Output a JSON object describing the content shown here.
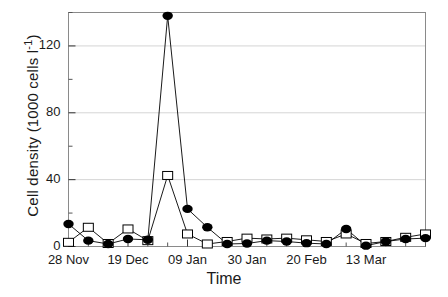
{
  "chart_data": {
    "type": "line",
    "title": "",
    "xlabel": "Time",
    "ylabel": "Cell density  (1000 cells l-1)",
    "ylabel_main": "Cell density  (1000 cells l",
    "ylabel_sup": "-1",
    "ylabel_tail": ")",
    "ylim": [
      0,
      140
    ],
    "yticks": [
      0,
      40,
      80,
      120
    ],
    "ytick_labels": [
      "0",
      "40",
      "80",
      "120"
    ],
    "xtick_labels": [
      "28 Nov",
      "19 Dec",
      "09 Jan",
      "30 Jan",
      "20 Feb",
      "13 Mar"
    ],
    "xtick_positions": [
      0,
      3,
      6,
      9,
      12,
      15
    ],
    "x_minor_count": 19,
    "grid": true,
    "legend": "none",
    "x": [
      0,
      1,
      2,
      3,
      4,
      5,
      6,
      7,
      8,
      9,
      10,
      11,
      12,
      13,
      14,
      15,
      16,
      17,
      18
    ],
    "series": [
      {
        "name": "filled-circle-series",
        "marker": "filled-circle",
        "color": "#000000",
        "values": [
          13.5,
          3.5,
          1.5,
          4.5,
          4.0,
          138.0,
          22.5,
          11.5,
          1.5,
          1.8,
          3.5,
          3.0,
          2.0,
          1.5,
          10.5,
          0.5,
          3.0,
          4.5,
          5.0
        ]
      },
      {
        "name": "open-square-series",
        "marker": "open-square",
        "color": "#000000",
        "values": [
          2.5,
          11.5,
          1.8,
          10.5,
          3.5,
          42.5,
          7.5,
          1.5,
          3.0,
          5.0,
          4.5,
          5.0,
          4.0,
          3.0,
          7.5,
          1.8,
          3.0,
          5.5,
          7.5
        ]
      }
    ]
  }
}
